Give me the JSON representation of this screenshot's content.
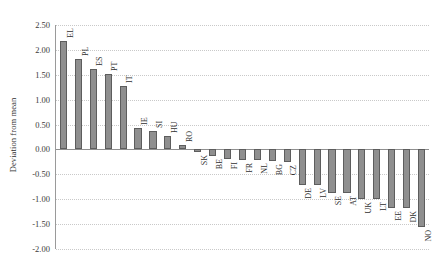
{
  "chart_data": {
    "type": "bar",
    "title": "",
    "subtitle": "",
    "xlabel": "",
    "ylabel": "Deviation from mean",
    "ylim": [
      -2.0,
      2.5
    ],
    "yticks": [
      "2.50",
      "2.00",
      "1.50",
      "1.00",
      "0.50",
      "0.00",
      "-0.50",
      "-1.00",
      "-1.50",
      "-2.00"
    ],
    "ytick_values": [
      2.5,
      2.0,
      1.5,
      1.0,
      0.5,
      0.0,
      -0.5,
      -1.0,
      -1.5,
      -2.0
    ],
    "grid": true,
    "legend": "none",
    "bar_color": "#8f8f8f",
    "bar_border_color": "#5d5d5d",
    "zero_line_color": "#8f8f8f",
    "categories": [
      "EL",
      "PL",
      "ES",
      "PT",
      "IT",
      "IE",
      "SI",
      "HU",
      "RO",
      "SK",
      "BE",
      "FI",
      "FR",
      "NL",
      "BG",
      "CZ",
      "DE",
      "LV",
      "SE",
      "AT",
      "UK",
      "LT",
      "EE",
      "DK",
      "NO"
    ],
    "values": [
      2.17,
      1.82,
      1.61,
      1.51,
      1.27,
      0.44,
      0.37,
      0.27,
      0.08,
      -0.05,
      -0.13,
      -0.2,
      -0.22,
      -0.22,
      -0.23,
      -0.25,
      -0.72,
      -0.72,
      -0.88,
      -0.88,
      -1.0,
      -1.0,
      -1.18,
      -1.18,
      -1.55
    ]
  }
}
